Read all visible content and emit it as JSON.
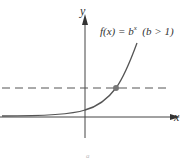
{
  "diagram": {
    "type": "function-graph",
    "axes": {
      "x_label": "x",
      "y_label": "y"
    },
    "function_label": {
      "lhs": "f(x) = b",
      "exponent": "x",
      "condition": "(b > 1)"
    },
    "features": {
      "curve": "exponential growth",
      "horizontal_dashed_line": true,
      "intersection_point": true
    },
    "caption": "a",
    "colors": {
      "curve": "#555555",
      "axes": "#444444",
      "dashed": "#555555",
      "point": "#777777"
    }
  }
}
